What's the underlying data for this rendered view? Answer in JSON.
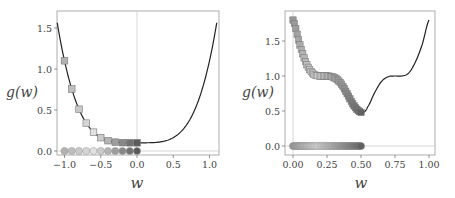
{
  "chart_data": [
    {
      "type": "line",
      "title": "",
      "xlabel": "w",
      "ylabel": "g(w)",
      "xlim": [
        -1.1,
        1.1
      ],
      "ylim": [
        -0.05,
        1.7
      ],
      "xticks": [
        "-1.0",
        "-0.5",
        "0.0",
        "0.5",
        "1.0"
      ],
      "yticks": [
        "0.0",
        "0.5",
        "1.0",
        "1.5"
      ],
      "grid": false,
      "curve": "g(w) = w^4 + 0.1",
      "series": [
        {
          "name": "gradient descent steps (on curve)",
          "marker": "square",
          "x": [
            -1.0,
            -0.9,
            -0.8,
            -0.7,
            -0.6,
            -0.5,
            -0.4,
            -0.3,
            -0.2,
            -0.1,
            0.0
          ],
          "y": [
            1.1,
            0.756,
            0.51,
            0.34,
            0.23,
            0.163,
            0.126,
            0.108,
            0.102,
            0.1,
            0.1
          ]
        },
        {
          "name": "steps projected on w-axis",
          "marker": "circle",
          "x": [
            -1.0,
            -0.9,
            -0.8,
            -0.7,
            -0.6,
            -0.5,
            -0.4,
            -0.3,
            -0.2,
            -0.1,
            0.0
          ],
          "y": [
            0,
            0,
            0,
            0,
            0,
            0,
            0,
            0,
            0,
            0,
            0
          ]
        }
      ]
    },
    {
      "type": "line",
      "title": "",
      "xlabel": "w",
      "ylabel": "g(w)",
      "xlim": [
        -0.05,
        1.05
      ],
      "ylim": [
        -0.1,
        1.9
      ],
      "xticks": [
        "0.00",
        "0.25",
        "0.50",
        "0.75",
        "1.00"
      ],
      "yticks": [
        "0.0",
        "0.5",
        "1.0",
        "1.5"
      ],
      "grid": false,
      "curve_points": {
        "x": [
          0.0,
          0.05,
          0.1,
          0.15,
          0.2,
          0.25,
          0.3,
          0.35,
          0.4,
          0.45,
          0.5,
          0.52,
          0.55,
          0.6,
          0.65,
          0.7,
          0.75,
          0.8,
          0.85,
          0.9,
          0.95,
          1.0
        ],
        "y": [
          1.8,
          1.45,
          1.17,
          1.03,
          1.0,
          1.0,
          0.98,
          0.9,
          0.74,
          0.57,
          0.48,
          0.48,
          0.56,
          0.76,
          0.92,
          0.99,
          1.0,
          1.0,
          1.04,
          1.2,
          1.45,
          1.8
        ]
      },
      "series": [
        {
          "name": "gradient descent steps (on curve)",
          "marker": "square",
          "x_range": [
            0.0,
            0.5
          ],
          "count": 50
        },
        {
          "name": "steps projected on w-axis",
          "marker": "circle",
          "x_range": [
            0.0,
            0.5
          ],
          "count": 50
        }
      ]
    }
  ],
  "left": {
    "xlabel": "w",
    "ylabel": "g(w)",
    "xticks": [
      "−1.0",
      "−0.5",
      "0.0",
      "0.5",
      "1.0"
    ],
    "yticks": [
      "0.0",
      "0.5",
      "1.0",
      "1.5"
    ]
  },
  "right": {
    "xlabel": "w",
    "ylabel": "g(w)",
    "xticks": [
      "0.00",
      "0.25",
      "0.50",
      "0.75",
      "1.00"
    ],
    "yticks": [
      "0.0",
      "0.5",
      "1.0",
      "1.5"
    ]
  },
  "colors": {
    "curve": "#222222",
    "axis": "#888888",
    "marker_light": "#e0e0e0",
    "marker_dark": "#5a5a5a"
  }
}
